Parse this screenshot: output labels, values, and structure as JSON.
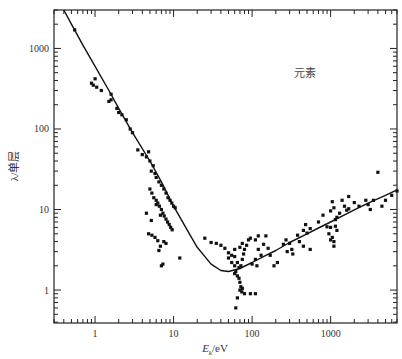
{
  "chart_data": {
    "type": "scatter",
    "title": "",
    "xlabel": "E_k/eV",
    "xlabel_main": "E",
    "xlabel_sub": "k",
    "xlabel_unit": "/eV",
    "ylabel": "λ/单层",
    "x_scale": "log",
    "y_scale": "log",
    "xlim": [
      0.3,
      7000
    ],
    "ylim": [
      0.39,
      3000
    ],
    "x_ticks": [
      1,
      10,
      100,
      1000
    ],
    "x_tick_labels": [
      "1",
      "10",
      "100",
      "1000"
    ],
    "y_ticks": [
      1,
      10,
      100,
      1000
    ],
    "y_tick_labels": [
      "1",
      "10",
      "100",
      "1000"
    ],
    "grid": false,
    "legend": null,
    "annotations": [
      {
        "text": "元素",
        "x": 1500,
        "y": 1000
      }
    ],
    "series": [
      {
        "name": "fit-curve",
        "kind": "line",
        "points": [
          [
            0.4,
            3000
          ],
          [
            0.5,
            2000
          ],
          [
            0.7,
            1100
          ],
          [
            1,
            600
          ],
          [
            1.5,
            300
          ],
          [
            2,
            180
          ],
          [
            3,
            90
          ],
          [
            5,
            40
          ],
          [
            7,
            22
          ],
          [
            10,
            11
          ],
          [
            15,
            5.5
          ],
          [
            20,
            3.4
          ],
          [
            30,
            2.1
          ],
          [
            40,
            1.75
          ],
          [
            50,
            1.7
          ],
          [
            70,
            1.85
          ],
          [
            100,
            2.2
          ],
          [
            150,
            2.7
          ],
          [
            200,
            3.1
          ],
          [
            300,
            3.9
          ],
          [
            500,
            5.0
          ],
          [
            700,
            5.9
          ],
          [
            1000,
            7.0
          ],
          [
            1500,
            8.6
          ],
          [
            2000,
            9.9
          ],
          [
            3000,
            12
          ],
          [
            5000,
            15
          ],
          [
            7000,
            17.5
          ]
        ]
      },
      {
        "name": "measured-elements",
        "kind": "scatter",
        "points": [
          [
            0.55,
            1700
          ],
          [
            0.9,
            370
          ],
          [
            0.95,
            350
          ],
          [
            1.0,
            420
          ],
          [
            1.05,
            330
          ],
          [
            1.2,
            300
          ],
          [
            1.5,
            220
          ],
          [
            1.6,
            230
          ],
          [
            1.6,
            270
          ],
          [
            1.9,
            180
          ],
          [
            2.0,
            160
          ],
          [
            2.2,
            150
          ],
          [
            2.5,
            130
          ],
          [
            2.8,
            100
          ],
          [
            3.0,
            90
          ],
          [
            3.5,
            55
          ],
          [
            4.0,
            48
          ],
          [
            4.5,
            45
          ],
          [
            4.8,
            52
          ],
          [
            5.0,
            40
          ],
          [
            5.5,
            35
          ],
          [
            5.2,
            30
          ],
          [
            5.8,
            28
          ],
          [
            6.0,
            25
          ],
          [
            6.5,
            22
          ],
          [
            7.0,
            20
          ],
          [
            7.5,
            18
          ],
          [
            8.0,
            16
          ],
          [
            8.5,
            14
          ],
          [
            9.0,
            13
          ],
          [
            9.5,
            12
          ],
          [
            10.0,
            11
          ],
          [
            10.5,
            10.5
          ],
          [
            5.0,
            18
          ],
          [
            5.3,
            16
          ],
          [
            5.6,
            14
          ],
          [
            6.0,
            13
          ],
          [
            6.3,
            12
          ],
          [
            6.6,
            11
          ],
          [
            7.0,
            10
          ],
          [
            7.3,
            9
          ],
          [
            7.6,
            8.3
          ],
          [
            8.0,
            7.6
          ],
          [
            8.4,
            7
          ],
          [
            8.8,
            6.5
          ],
          [
            9.2,
            6
          ],
          [
            9.6,
            5.6
          ],
          [
            6.0,
            11.5
          ],
          [
            6.8,
            8.5
          ],
          [
            4.8,
            5.0
          ],
          [
            5.3,
            4.8
          ],
          [
            5.8,
            4.5
          ],
          [
            6.3,
            4.1
          ],
          [
            6.8,
            3.5
          ],
          [
            7.5,
            4.0
          ],
          [
            8.0,
            3.8
          ],
          [
            6.5,
            3.1
          ],
          [
            7.3,
            2.1
          ],
          [
            7.0,
            2.0
          ],
          [
            12,
            2.5
          ],
          [
            4.5,
            9
          ],
          [
            5.2,
            7.3
          ],
          [
            25,
            4.4
          ],
          [
            30,
            3.9
          ],
          [
            35,
            3.8
          ],
          [
            40,
            3.6
          ],
          [
            45,
            3.3
          ],
          [
            50,
            2.9
          ],
          [
            50,
            2.5
          ],
          [
            55,
            2.7
          ],
          [
            60,
            3.2
          ],
          [
            55,
            2.2
          ],
          [
            60,
            2.0
          ],
          [
            62,
            1.7
          ],
          [
            60,
            1.6
          ],
          [
            65,
            1.5
          ],
          [
            68,
            1.4
          ],
          [
            70,
            1.25
          ],
          [
            72,
            1.1
          ],
          [
            75,
            1.05
          ],
          [
            70,
            1.0
          ],
          [
            74,
            0.95
          ],
          [
            65,
            0.8
          ],
          [
            62,
            0.6
          ],
          [
            60,
            2.6
          ],
          [
            65,
            2.2
          ],
          [
            68,
            1.9
          ],
          [
            72,
            2.0
          ],
          [
            75,
            2.4
          ],
          [
            78,
            2.8
          ],
          [
            80,
            3.2
          ],
          [
            85,
            3.6
          ],
          [
            90,
            4.2
          ],
          [
            95,
            4.4
          ],
          [
            70,
            3.4
          ],
          [
            75,
            3.8
          ],
          [
            80,
            0.9
          ],
          [
            95,
            0.9
          ],
          [
            110,
            0.9
          ],
          [
            100,
            2.1
          ],
          [
            110,
            2.4
          ],
          [
            115,
            2.0
          ],
          [
            120,
            3.2
          ],
          [
            130,
            2.7
          ],
          [
            110,
            4.2
          ],
          [
            120,
            4.7
          ],
          [
            140,
            3.7
          ],
          [
            150,
            4.7
          ],
          [
            160,
            3.3
          ],
          [
            170,
            2.7
          ],
          [
            190,
            2.0
          ],
          [
            210,
            2.2
          ],
          [
            250,
            3.7
          ],
          [
            270,
            4.2
          ],
          [
            300,
            3.8
          ],
          [
            320,
            3.2
          ],
          [
            280,
            3.0
          ],
          [
            330,
            2.8
          ],
          [
            380,
            4.8
          ],
          [
            400,
            4.0
          ],
          [
            450,
            5.5
          ],
          [
            480,
            6.5
          ],
          [
            500,
            5.1
          ],
          [
            550,
            5.8
          ],
          [
            450,
            3.5
          ],
          [
            550,
            3.2
          ],
          [
            700,
            7.0
          ],
          [
            800,
            8.5
          ],
          [
            900,
            6.1
          ],
          [
            950,
            5.0
          ],
          [
            1000,
            9.6
          ],
          [
            1050,
            12.5
          ],
          [
            1100,
            10.5
          ],
          [
            1150,
            7.5
          ],
          [
            1200,
            8.0
          ],
          [
            1000,
            6.0
          ],
          [
            1050,
            4.5
          ],
          [
            1000,
            4.2
          ],
          [
            1100,
            4.0
          ],
          [
            1100,
            3.5
          ],
          [
            1200,
            5.5
          ],
          [
            1150,
            6.2
          ],
          [
            1300,
            9.0
          ],
          [
            1400,
            13
          ],
          [
            1500,
            11
          ],
          [
            1600,
            9.8
          ],
          [
            1700,
            10.2
          ],
          [
            1700,
            14.5
          ],
          [
            2000,
            12.2
          ],
          [
            2300,
            11.0
          ],
          [
            2800,
            13
          ],
          [
            3000,
            11.5
          ],
          [
            3200,
            10.0
          ],
          [
            3500,
            13
          ],
          [
            4000,
            29
          ],
          [
            4500,
            11
          ],
          [
            5000,
            13
          ],
          [
            6000,
            15
          ],
          [
            7000,
            17
          ]
        ]
      }
    ]
  }
}
